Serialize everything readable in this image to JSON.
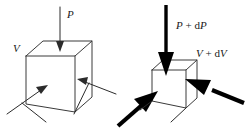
{
  "figure": {
    "panels": [
      {
        "id": "initial-state",
        "name": "initial-state-panel",
        "cube_label": "cube-initial",
        "pressure_label": "P",
        "volume_label": "V",
        "arrow_style": "thin",
        "arrow_count": 3,
        "description": "Cube with thin arrows representing pressure P acting on volume V"
      },
      {
        "id": "compressed-state",
        "name": "compressed-state-panel",
        "cube_label": "cube-compressed",
        "pressure_label_parts": {
          "symbol": "P",
          "operator": " + ",
          "differential": "d",
          "variable": "P"
        },
        "pressure_label": "P + dP",
        "volume_label_parts": {
          "symbol": "V",
          "operator": " + ",
          "differential": "d",
          "variable": "V"
        },
        "volume_label": "V + dV",
        "arrow_style": "bold",
        "arrow_count": 3,
        "description": "Smaller cube with bold arrows representing increased pressure P + dP and changed volume V + dV"
      }
    ],
    "colors": {
      "background": "#ffffff",
      "thin_stroke": "#2b2b2b",
      "cube_stroke": "#3a3a3a",
      "bold_stroke": "#000000",
      "text": "#1a1a1a"
    }
  }
}
